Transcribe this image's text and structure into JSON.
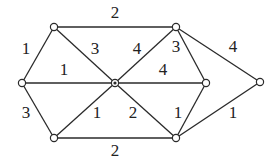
{
  "graph": {
    "nodes": [
      {
        "id": "A",
        "x": 54,
        "y": 27
      },
      {
        "id": "B",
        "x": 176,
        "y": 27
      },
      {
        "id": "C",
        "x": 22,
        "y": 83
      },
      {
        "id": "D",
        "x": 115,
        "y": 83,
        "hub": true
      },
      {
        "id": "E",
        "x": 206,
        "y": 83
      },
      {
        "id": "F",
        "x": 260,
        "y": 82
      },
      {
        "id": "G",
        "x": 54,
        "y": 138
      },
      {
        "id": "H",
        "x": 176,
        "y": 138
      }
    ],
    "edges": [
      {
        "from": "A",
        "to": "B",
        "weight": "2",
        "lx": 115,
        "ly": 14
      },
      {
        "from": "A",
        "to": "C",
        "weight": "1",
        "lx": 26,
        "ly": 50
      },
      {
        "from": "A",
        "to": "D",
        "weight": "3",
        "lx": 95,
        "ly": 50
      },
      {
        "from": "B",
        "to": "D",
        "weight": "4",
        "lx": 137,
        "ly": 50
      },
      {
        "from": "B",
        "to": "E",
        "weight": "3",
        "lx": 176,
        "ly": 48
      },
      {
        "from": "B",
        "to": "F",
        "weight": "4",
        "lx": 233,
        "ly": 48
      },
      {
        "from": "C",
        "to": "D",
        "weight": "1",
        "lx": 64,
        "ly": 71
      },
      {
        "from": "D",
        "to": "E",
        "weight": "4",
        "lx": 163,
        "ly": 71
      },
      {
        "from": "C",
        "to": "G",
        "weight": "3",
        "lx": 26,
        "ly": 114
      },
      {
        "from": "D",
        "to": "G",
        "weight": "1",
        "lx": 97,
        "ly": 114
      },
      {
        "from": "D",
        "to": "H",
        "weight": "2",
        "lx": 133,
        "ly": 114
      },
      {
        "from": "E",
        "to": "H",
        "weight": "1",
        "lx": 178,
        "ly": 114
      },
      {
        "from": "G",
        "to": "H",
        "weight": "2",
        "lx": 115,
        "ly": 152
      },
      {
        "from": "H",
        "to": "F",
        "weight": "1",
        "lx": 233,
        "ly": 114
      }
    ]
  }
}
